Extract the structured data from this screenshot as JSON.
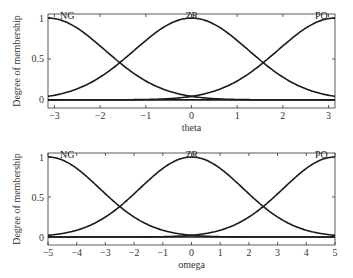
{
  "chart_data": [
    {
      "type": "line",
      "title": "",
      "xlabel": "theta",
      "ylabel": "Degree of membership",
      "xlim": [
        -3.1416,
        3.1416
      ],
      "ylim": [
        -0.1,
        1.05
      ],
      "xticks": [
        -3,
        -2,
        -1,
        0,
        1,
        2,
        3
      ],
      "xtick_labels": [
        "−3",
        "−2",
        "−1",
        "0",
        "1",
        "2",
        "3"
      ],
      "yticks": [
        0,
        0.5,
        1
      ],
      "ytick_labels": [
        "0",
        "0.5",
        "1"
      ],
      "grid": false,
      "legend": "none (curve labels inside plot)",
      "series": [
        {
          "name": "NG",
          "shape": "gaussian",
          "center": -3.1416,
          "sigma": 1.25
        },
        {
          "name": "ZR",
          "shape": "gaussian",
          "center": 0,
          "sigma": 1.25
        },
        {
          "name": "PO",
          "shape": "gaussian",
          "center": 3.1416,
          "sigma": 1.25
        }
      ],
      "annotations": [
        "NG",
        "ZR",
        "PO"
      ]
    },
    {
      "type": "line",
      "title": "",
      "xlabel": "omega",
      "ylabel": "Degree of membership",
      "xlim": [
        -5,
        5
      ],
      "ylim": [
        -0.1,
        1.05
      ],
      "xticks": [
        -5,
        -4,
        -3,
        -2,
        -1,
        0,
        1,
        2,
        3,
        4,
        5
      ],
      "xtick_labels": [
        "−5",
        "−4",
        "−3",
        "−2",
        "−1",
        "0",
        "1",
        "2",
        "3",
        "4",
        "5"
      ],
      "yticks": [
        0,
        0.5,
        1
      ],
      "ytick_labels": [
        "0",
        "0.5",
        "1"
      ],
      "grid": false,
      "legend": "none (curve labels inside plot)",
      "series": [
        {
          "name": "NG",
          "shape": "gaussian",
          "center": -5,
          "sigma": 1.8
        },
        {
          "name": "ZR",
          "shape": "gaussian",
          "center": 0,
          "sigma": 1.8
        },
        {
          "name": "PO",
          "shape": "gaussian",
          "center": 5,
          "sigma": 1.8
        }
      ],
      "annotations": [
        "NG",
        "ZR",
        "PO"
      ]
    }
  ],
  "plots": [
    {
      "box": {
        "x": 48,
        "y": 14,
        "w": 287,
        "h": 94
      },
      "ylabel": "Degree of membership",
      "xlabel": "theta",
      "labels": {
        "ng": "NG",
        "zr": "ZR",
        "po": "PO"
      }
    },
    {
      "box": {
        "x": 48,
        "y": 153,
        "w": 287,
        "h": 92
      },
      "ylabel": "Degree of membership",
      "xlabel": "omega",
      "labels": {
        "ng": "NG",
        "zr": "ZR",
        "po": "PO"
      }
    }
  ],
  "colors": {
    "line": "#1a1a1a",
    "axis": "#333333",
    "background": "#ffffff"
  }
}
